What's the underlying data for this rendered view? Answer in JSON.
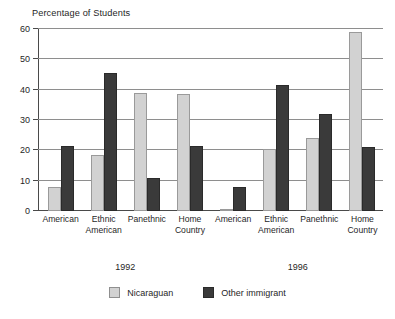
{
  "chart_data": {
    "type": "bar",
    "title": "",
    "ylabel": "Percentage of Students",
    "xlabel": "",
    "ylim": [
      0,
      60
    ],
    "yticks": [
      0,
      10,
      20,
      30,
      40,
      50,
      60
    ],
    "ytick_labels": [
      "0",
      "10",
      "20",
      "30",
      "40",
      "50",
      "60"
    ],
    "grid": true,
    "legend_position": "bottom-center",
    "categories": [
      "American",
      "Ethnic American",
      "Panethnic",
      "Home Country",
      "American",
      "Ethnic American",
      "Panethnic",
      "Home Country"
    ],
    "category_lines": [
      [
        "American",
        ""
      ],
      [
        "Ethnic",
        "American"
      ],
      [
        "Panethnic",
        ""
      ],
      [
        "Home",
        "Country"
      ],
      [
        "American",
        ""
      ],
      [
        "Ethnic",
        "American"
      ],
      [
        "Panethnic",
        ""
      ],
      [
        "Home",
        "Country"
      ]
    ],
    "group_labels": [
      "1992",
      "1996"
    ],
    "series": [
      {
        "name": "Nicaraguan",
        "color": "#d2d2d2",
        "values": [
          8,
          18.5,
          39,
          38.5,
          0.5,
          20.5,
          24,
          59
        ]
      },
      {
        "name": "Other immigrant",
        "color": "#3a3a3a",
        "values": [
          21.5,
          45.5,
          11,
          21.5,
          8,
          41.5,
          32,
          21
        ]
      }
    ]
  },
  "legend": {
    "items": [
      {
        "label": "Nicaraguan",
        "swatch": "light-gray-swatch"
      },
      {
        "label": "Other immigrant",
        "swatch": "dark-gray-swatch"
      }
    ]
  }
}
